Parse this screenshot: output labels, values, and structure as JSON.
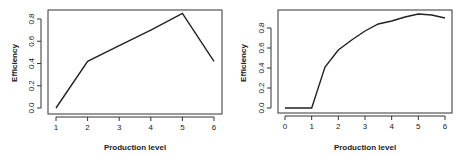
{
  "chart_data": [
    {
      "type": "line",
      "title": "",
      "xlabel": "Production level",
      "ylabel": "Efficiency",
      "x": [
        1,
        2,
        3,
        4,
        5,
        6
      ],
      "series": [
        {
          "name": "Efficiency",
          "values": [
            0.0,
            0.42,
            0.56,
            0.7,
            0.85,
            0.42
          ]
        }
      ],
      "xticks": [
        "1",
        "2",
        "3",
        "4",
        "5",
        "6"
      ],
      "yticks": [
        "0.0",
        "0.2",
        "0.4",
        "0.6",
        "0.8"
      ],
      "xlim": [
        1,
        6
      ],
      "ylim": [
        0,
        0.85
      ],
      "grid": false,
      "legend": "none"
    },
    {
      "type": "line",
      "title": "",
      "xlabel": "Production level",
      "ylabel": "Efficiency",
      "x": [
        0,
        1,
        1.5,
        2,
        2.5,
        3,
        3.5,
        4,
        4.5,
        5,
        5.5,
        6
      ],
      "series": [
        {
          "name": "Efficiency",
          "values": [
            0.0,
            0.0,
            0.41,
            0.58,
            0.68,
            0.77,
            0.84,
            0.87,
            0.91,
            0.94,
            0.93,
            0.9
          ]
        }
      ],
      "xticks": [
        "0",
        "1",
        "2",
        "3",
        "4",
        "5",
        "6"
      ],
      "yticks": [
        "0.0",
        "0.2",
        "0.4",
        "0.6",
        "0.8"
      ],
      "xlim": [
        0,
        6
      ],
      "ylim": [
        0,
        0.94
      ],
      "grid": false,
      "legend": "none"
    }
  ]
}
